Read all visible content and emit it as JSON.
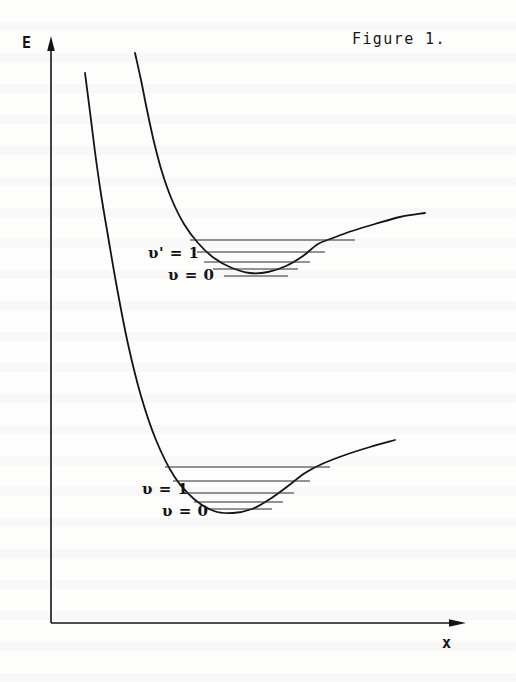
{
  "figure": {
    "caption": "Figure 1.",
    "background_color": "#fdfdfc",
    "ink_color": "#141417"
  },
  "axes": {
    "y_label": "E",
    "x_label": "x",
    "y_axis": {
      "x": 51,
      "top": 38,
      "bottom": 623
    },
    "x_axis": {
      "y": 623,
      "left": 51,
      "right": 465
    },
    "arrowheads": "both"
  },
  "labels": {
    "upper_v1": "υ' = 1",
    "upper_v0": "υ = 0",
    "lower_v1": "υ = 1",
    "lower_v0": "υ = 0"
  },
  "chart_data": {
    "type": "line",
    "title": "Figure 1.",
    "subtitle": "Morse potential energy curves for ground and excited electronic states with vibrational energy levels",
    "xlabel": "x",
    "ylabel": "E",
    "xlim": [
      51,
      465
    ],
    "ylim": [
      623,
      38
    ],
    "grid": false,
    "legend": "none",
    "note": "y axis is inverted in pixel space: smaller y = higher energy",
    "series": [
      {
        "name": "excited-state-potential",
        "description": "Upper Morse potential curve (excited electronic state)",
        "path_points": [
          [
            135,
            53
          ],
          [
            141,
            80
          ],
          [
            147,
            110
          ],
          [
            154,
            142
          ],
          [
            162,
            172
          ],
          [
            172,
            200
          ],
          [
            184,
            224
          ],
          [
            198,
            243
          ],
          [
            214,
            258
          ],
          [
            232,
            268
          ],
          [
            250,
            273
          ],
          [
            268,
            272
          ],
          [
            286,
            266
          ],
          [
            303,
            256
          ],
          [
            318,
            244
          ],
          [
            333,
            238
          ],
          [
            352,
            231
          ],
          [
            375,
            224
          ],
          [
            400,
            217
          ],
          [
            425,
            213
          ]
        ],
        "minimum": [
          262,
          273
        ],
        "levels": [
          {
            "v": 4,
            "y": 240,
            "x_left": 190,
            "x_right": 355
          },
          {
            "v": 3,
            "y": 252,
            "x_left": 197,
            "x_right": 325
          },
          {
            "v": 2,
            "y": 262,
            "x_left": 204,
            "x_right": 310
          },
          {
            "v": 1,
            "y": 269,
            "x_left": 213,
            "x_right": 298
          },
          {
            "v": 0,
            "y": 276,
            "x_left": 224,
            "x_right": 288
          }
        ]
      },
      {
        "name": "ground-state-potential",
        "description": "Lower Morse potential curve (ground electronic state)",
        "path_points": [
          [
            85,
            73
          ],
          [
            90,
            112
          ],
          [
            95,
            152
          ],
          [
            101,
            194
          ],
          [
            108,
            236
          ],
          [
            117,
            288
          ],
          [
            128,
            344
          ],
          [
            141,
            396
          ],
          [
            156,
            440
          ],
          [
            174,
            476
          ],
          [
            194,
            499
          ],
          [
            214,
            511
          ],
          [
            233,
            513
          ],
          [
            252,
            509
          ],
          [
            270,
            499
          ],
          [
            288,
            486
          ],
          [
            305,
            473
          ],
          [
            322,
            464
          ],
          [
            345,
            455
          ],
          [
            370,
            447
          ],
          [
            395,
            440
          ]
        ],
        "minimum": [
          233,
          513
        ],
        "levels": [
          {
            "v": 4,
            "y": 467,
            "x_left": 165,
            "x_right": 330
          },
          {
            "v": 3,
            "y": 481,
            "x_left": 173,
            "x_right": 310
          },
          {
            "v": 2,
            "y": 493,
            "x_left": 183,
            "x_right": 294
          },
          {
            "v": 1,
            "y": 502,
            "x_left": 194,
            "x_right": 283
          },
          {
            "v": 0,
            "y": 509,
            "x_left": 205,
            "x_right": 272
          }
        ]
      }
    ],
    "annotations": [
      {
        "text": "υ' = 1",
        "x": 148,
        "y": 244,
        "target": "excited-state-potential"
      },
      {
        "text": "υ = 0",
        "x": 168,
        "y": 266,
        "target": "excited-state-potential"
      },
      {
        "text": "υ = 1",
        "x": 142,
        "y": 480,
        "target": "ground-state-potential"
      },
      {
        "text": "υ = 0",
        "x": 162,
        "y": 502,
        "target": "ground-state-potential"
      }
    ]
  }
}
